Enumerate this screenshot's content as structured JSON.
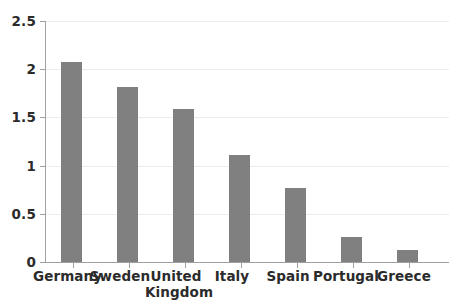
{
  "chart_data": {
    "type": "bar",
    "title": "",
    "subtitle": "",
    "xlabel": "",
    "ylabel": "",
    "categories": [
      "Germany",
      "Sweden",
      "United Kingdom",
      "Italy",
      "Spain",
      "Portugal",
      "Greece"
    ],
    "category_labels_display": [
      "Germany",
      "Sweden",
      "United\nKingdom",
      "Italy",
      "Spain",
      "Portugal",
      "Greece"
    ],
    "values": [
      2.08,
      1.82,
      1.59,
      1.11,
      0.77,
      0.26,
      0.12
    ],
    "ylim": [
      0,
      2.5
    ],
    "yticks": [
      0,
      0.5,
      1,
      1.5,
      2,
      2.5
    ],
    "ytick_labels": [
      "0",
      "0.5",
      "1",
      "1.5",
      "2",
      "2.5"
    ],
    "grid": true,
    "grid_axis": "y",
    "legend": false,
    "legend_position": "none",
    "series": [
      {
        "name": "",
        "values": [
          2.08,
          1.82,
          1.59,
          1.11,
          0.77,
          0.26,
          0.12
        ]
      }
    ],
    "colors": {
      "bar": "#808080",
      "gridline": "#ececec",
      "axis": "#a0a0a0",
      "text": "#2b2b2b",
      "background": "#ffffff"
    }
  }
}
